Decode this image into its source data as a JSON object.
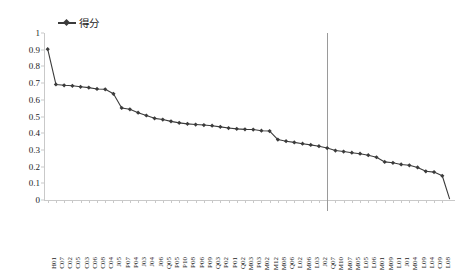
{
  "legend": {
    "entries": [
      {
        "label": "得分",
        "color": "#3b3b3b",
        "marker": "line-with-diamond-marker"
      }
    ]
  },
  "chart_data": {
    "type": "line",
    "title": "",
    "subtitle": "",
    "xlabel": "",
    "ylabel": "",
    "ylim": [
      0,
      1
    ],
    "yticks": [
      0,
      0.1,
      0.2,
      0.3,
      0.4,
      0.5,
      0.6,
      0.7,
      0.8,
      0.9,
      1
    ],
    "ytick_labels": [
      "0",
      "0.1",
      "0.2",
      "0.3",
      "0.4",
      "0.5",
      "0.6",
      "0.7",
      "0.8",
      "0.9",
      "1"
    ],
    "grid": false,
    "legend_position": "top-left",
    "series_name": "得分",
    "series_color": "#3b3b3b",
    "categories": [
      "H01",
      "C07",
      "C02",
      "C05",
      "C03",
      "C06",
      "C08",
      "C04",
      "J05",
      "P07",
      "P04",
      "J03",
      "J04",
      "J06",
      "Q05",
      "P05",
      "P10",
      "P08",
      "P06",
      "P09",
      "Q03",
      "P02",
      "P01",
      "Q02",
      "M03",
      "P03",
      "M02",
      "M12",
      "M08",
      "Q06",
      "L02",
      "M06",
      "L03",
      "J02",
      "Q07",
      "M10",
      "M07",
      "M05",
      "L05",
      "L06",
      "M01",
      "M09",
      "L01",
      "J01",
      "M04",
      "L09",
      "L04",
      "C09",
      "L08"
    ],
    "values": [
      0.903,
      0.692,
      0.687,
      0.684,
      0.678,
      0.673,
      0.665,
      0.663,
      0.636,
      0.551,
      0.543,
      0.523,
      0.506,
      0.489,
      0.482,
      0.471,
      0.462,
      0.456,
      0.452,
      0.449,
      0.445,
      0.438,
      0.431,
      0.426,
      0.423,
      0.422,
      0.415,
      0.413,
      0.362,
      0.352,
      0.345,
      0.337,
      0.33,
      0.322,
      0.311,
      0.296,
      0.29,
      0.283,
      0.277,
      0.268,
      0.256,
      0.228,
      0.223,
      0.213,
      0.208,
      0.195,
      0.172,
      0.167,
      0.145
    ],
    "annotations": [
      {
        "type": "vertical-reference-line",
        "at_category": "Q07",
        "at_index": 34,
        "color": "#9a9a9a"
      }
    ],
    "tail_drop_to": 0.005
  }
}
